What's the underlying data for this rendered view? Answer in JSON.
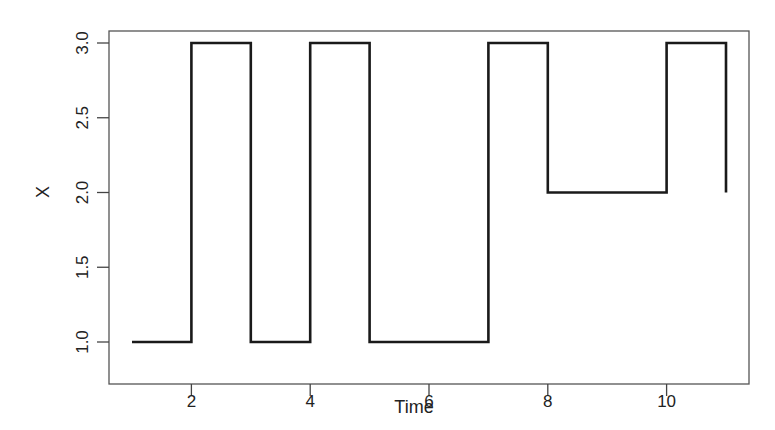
{
  "chart_data": {
    "type": "line",
    "subtype": "step",
    "title": "",
    "xlabel": "Time",
    "ylabel": "X",
    "x": [
      1,
      2,
      3,
      4,
      5,
      6,
      7,
      8,
      9,
      10,
      11
    ],
    "series": [
      {
        "name": "X",
        "values": [
          1,
          3,
          1,
          3,
          1,
          1,
          3,
          2,
          2,
          3,
          2
        ]
      }
    ],
    "xlim": [
      0.6,
      11.4
    ],
    "ylim": [
      0.92,
      3.08
    ],
    "xticks": [
      2,
      4,
      6,
      8,
      10
    ],
    "xtick_labels": [
      "2",
      "4",
      "6",
      "8",
      "10"
    ],
    "yticks": [
      1.0,
      1.5,
      2.0,
      2.5,
      3.0
    ],
    "ytick_labels": [
      "1.0",
      "1.5",
      "2.0",
      "2.5",
      "3.0"
    ],
    "grid": false,
    "legend": null,
    "line_color": "#1a1a1a",
    "axis_color": "#444444"
  }
}
